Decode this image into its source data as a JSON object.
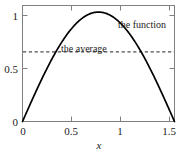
{
  "chart_data": {
    "type": "line",
    "title": "",
    "xlabel": "x",
    "ylabel": "",
    "xlim": [
      0,
      1.5707963
    ],
    "ylim": [
      0,
      1.06
    ],
    "grid": false,
    "legend_position": "inline-annotations",
    "xticks": [
      0,
      0.5,
      1,
      1.5
    ],
    "xtick_labels": [
      "0",
      "0.5",
      "1",
      "1.5"
    ],
    "yticks": [
      0,
      0.5,
      1
    ],
    "ytick_labels": [
      "0",
      "0.5",
      "1"
    ],
    "series": [
      {
        "name": "the function",
        "style": "solid",
        "color": "#000000",
        "formula": "sin(2x)",
        "x": [
          0.0,
          0.0785,
          0.1571,
          0.2356,
          0.3142,
          0.3927,
          0.4712,
          0.5498,
          0.6283,
          0.7069,
          0.7854,
          0.8639,
          0.9425,
          1.021,
          1.0996,
          1.1781,
          1.2566,
          1.3352,
          1.4137,
          1.4923,
          1.5708
        ],
        "values": [
          0.0,
          0.1564,
          0.309,
          0.454,
          0.5878,
          0.7071,
          0.809,
          0.891,
          0.951,
          0.9877,
          1.0,
          0.9877,
          0.951,
          0.891,
          0.809,
          0.7071,
          0.5878,
          0.454,
          0.309,
          0.1564,
          0.0
        ]
      },
      {
        "name": "the average",
        "style": "dashed",
        "color": "#4d4d4d",
        "formula": "2/pi",
        "constant_value": 0.6366
      }
    ],
    "annotations": [
      {
        "text": "the function",
        "x": 1.07,
        "y": 0.855
      },
      {
        "text": "the average",
        "x": 0.63,
        "y": 0.72
      }
    ]
  },
  "axes": {
    "x_title": "x",
    "x_tick_0": "0",
    "x_tick_1": "0.5",
    "x_tick_2": "1",
    "x_tick_3": "1.5",
    "y_tick_0": "0",
    "y_tick_1": "0.5",
    "y_tick_2": "1"
  },
  "labels": {
    "function_label": "the function",
    "average_label": "the average"
  },
  "colors": {
    "curve": "#000000",
    "average_line": "#4d4d4d",
    "frame": "#808080",
    "text": "#1a1a1a",
    "background": "#ffffff"
  }
}
